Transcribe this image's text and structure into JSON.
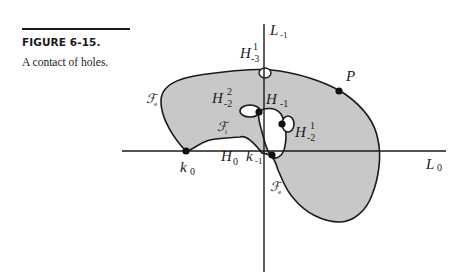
{
  "figure": {
    "number_label": "FIGURE 6-15.",
    "caption": "A contact of holes."
  },
  "diagram": {
    "colors": {
      "fill": "#c8c8c8",
      "stroke": "#1a1a1a",
      "hole": "#ffffff"
    },
    "axes": {
      "vertical": {
        "name": "L",
        "sub": "-1"
      },
      "horizontal": {
        "name": "L",
        "sub": "0"
      }
    },
    "labels": {
      "H_-3_1": {
        "name": "H",
        "sup": "1",
        "sub": "-3"
      },
      "H_-2_2": {
        "name": "H",
        "sup": "2",
        "sub": "-2"
      },
      "H_-1": {
        "name": "H",
        "sub": "-1"
      },
      "H_-2_1": {
        "name": "H",
        "sup": "1",
        "sub": "-2"
      },
      "H_0": {
        "name": "H",
        "sub": "0"
      },
      "k_-1": {
        "name": "k",
        "sub": "-1"
      },
      "k_0": {
        "name": "k",
        "sub": "0"
      },
      "P": {
        "name": "P"
      },
      "F_e_top": {
        "name": "ℱ",
        "sub": "e"
      },
      "F_i": {
        "name": "ℱ",
        "sub": "i"
      },
      "F_e_bottom": {
        "name": "ℱ",
        "sub": "e"
      }
    }
  }
}
